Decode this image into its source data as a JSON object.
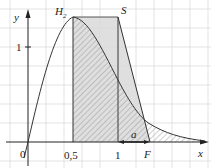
{
  "figure": {
    "type": "function-graph",
    "curve_label": "H",
    "curve_label_sub": "2",
    "point_S_label": "S",
    "point_F_label": "F",
    "segment_label": "a",
    "axes": {
      "x_label": "x",
      "y_label": "y",
      "origin_label": "0",
      "x_ticks": [
        {
          "value": 0.5,
          "label": "0,5"
        },
        {
          "value": 1,
          "label": "1"
        }
      ],
      "y_ticks": [
        {
          "value": 1,
          "label": "1"
        }
      ]
    },
    "regions": {
      "rectangle_trapezoid": {
        "description": "light gray region from x=0.5 to F under line H2-S-F",
        "fill": "#d9d9d9"
      },
      "hatched": {
        "description": "hatched area under curve from x=0.5",
        "stroke": "#888888"
      }
    },
    "colors": {
      "grid": "#d8d8d8",
      "axis": "#222222",
      "curve": "#333333",
      "fill": "#d9d9d9",
      "hatch": "#8a8a8a"
    },
    "values": {
      "peak_x": 0.5,
      "peak_y": 1.32,
      "S_x": 1,
      "F_x": 1.35
    }
  }
}
